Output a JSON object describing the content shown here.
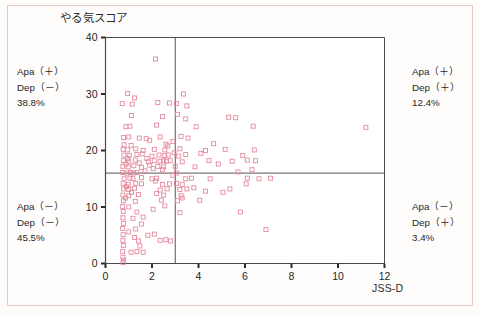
{
  "figure": {
    "frame_color": "#edc7cc",
    "background": "#fefdfc"
  },
  "quadrants": {
    "top_left": {
      "line1": "Apa（＋）",
      "line2": "Dep（－）",
      "percent": "38.8%"
    },
    "top_right": {
      "line1": "Apa（＋）",
      "line2": "Dep（＋）",
      "percent": "12.4%"
    },
    "bottom_left": {
      "line1": "Apa（－）",
      "line2": "Dep（－）",
      "percent": "45.5%"
    },
    "bottom_right": {
      "line1": "Apa（－）",
      "line2": "Dep（＋）",
      "percent": "3.4%"
    }
  },
  "chart_data": {
    "type": "scatter",
    "title": "",
    "xlabel": "JSS-D",
    "ylabel": "やる気スコア",
    "xlim": [
      0,
      12
    ],
    "ylim": [
      0,
      40
    ],
    "xticks": [
      0,
      2,
      4,
      6,
      8,
      10,
      12
    ],
    "yticks": [
      0,
      10,
      20,
      30,
      40
    ],
    "grid": false,
    "legend": "none",
    "marker": {
      "shape": "open-square",
      "size_px": 4,
      "edge_color": "#e58a9e",
      "fill_color": "none"
    },
    "reference_lines": [
      {
        "axis": "x",
        "value": 3,
        "color": "#555555",
        "label": "JSS-D cutoff"
      },
      {
        "axis": "y",
        "value": 16,
        "color": "#555555",
        "label": "yaruki score cutoff"
      }
    ],
    "annotations": [
      {
        "text": "Apa（＋） Dep（－） 38.8%",
        "quadrant": "top-left"
      },
      {
        "text": "Apa（＋） Dep（＋） 12.4%",
        "quadrant": "top-right"
      },
      {
        "text": "Apa（－） Dep（－） 45.5%",
        "quadrant": "bottom-left"
      },
      {
        "text": "Apa（－） Dep（＋） 3.4%",
        "quadrant": "bottom-right"
      }
    ],
    "points": [
      [
        2.15,
        36.2
      ],
      [
        0.95,
        30.1
      ],
      [
        1.25,
        29.3
      ],
      [
        3.35,
        30.0
      ],
      [
        0.72,
        28.3
      ],
      [
        1.15,
        28.2
      ],
      [
        2.25,
        28.5
      ],
      [
        2.75,
        28.4
      ],
      [
        3.05,
        28.3
      ],
      [
        3.5,
        27.9
      ],
      [
        1.12,
        26.2
      ],
      [
        2.45,
        26.0
      ],
      [
        3.1,
        26.4
      ],
      [
        3.45,
        25.6
      ],
      [
        5.3,
        25.9
      ],
      [
        5.6,
        25.8
      ],
      [
        0.88,
        24.2
      ],
      [
        1.05,
        24.3
      ],
      [
        2.2,
        24.5
      ],
      [
        3.9,
        24.2
      ],
      [
        6.35,
        24.3
      ],
      [
        11.2,
        24.1
      ],
      [
        0.78,
        22.3
      ],
      [
        1.0,
        22.4
      ],
      [
        1.45,
        22.2
      ],
      [
        1.75,
        22.1
      ],
      [
        2.35,
        22.4
      ],
      [
        3.25,
        22.5
      ],
      [
        3.55,
        22.2
      ],
      [
        0.8,
        21.0
      ],
      [
        1.1,
        20.9
      ],
      [
        2.6,
        21.1
      ],
      [
        4.65,
        21.2
      ],
      [
        0.76,
        20.2
      ],
      [
        0.95,
        20.1
      ],
      [
        1.3,
        20.3
      ],
      [
        1.62,
        20.0
      ],
      [
        2.1,
        20.2
      ],
      [
        2.55,
        20.1
      ],
      [
        3.2,
        20.3
      ],
      [
        4.3,
        20.0
      ],
      [
        5.15,
        20.2
      ],
      [
        6.4,
        20.1
      ],
      [
        0.79,
        19.2
      ],
      [
        1.02,
        19.1
      ],
      [
        1.35,
        19.3
      ],
      [
        2.0,
        19.0
      ],
      [
        2.3,
        19.2
      ],
      [
        2.55,
        19.1
      ],
      [
        2.7,
        19.2
      ],
      [
        3.15,
        19.0
      ],
      [
        3.45,
        19.3
      ],
      [
        5.9,
        19.1
      ],
      [
        0.77,
        18.2
      ],
      [
        1.0,
        18.1
      ],
      [
        1.28,
        18.3
      ],
      [
        1.85,
        18.0
      ],
      [
        2.1,
        18.2
      ],
      [
        2.35,
        18.1
      ],
      [
        2.5,
        18.2
      ],
      [
        2.62,
        18.1
      ],
      [
        2.78,
        18.2
      ],
      [
        3.3,
        18.0
      ],
      [
        4.45,
        18.2
      ],
      [
        5.45,
        18.1
      ],
      [
        6.1,
        18.3
      ],
      [
        6.45,
        18.2
      ],
      [
        0.75,
        17.2
      ],
      [
        0.98,
        17.1
      ],
      [
        1.22,
        17.3
      ],
      [
        1.55,
        17.0
      ],
      [
        2.25,
        17.2
      ],
      [
        2.5,
        17.1
      ],
      [
        3.0,
        17.2
      ],
      [
        3.85,
        17.1
      ],
      [
        0.74,
        16.1
      ],
      [
        0.92,
        16.0
      ],
      [
        1.08,
        16.1
      ],
      [
        1.2,
        16.0
      ],
      [
        1.35,
        16.1
      ],
      [
        3.05,
        16.0
      ],
      [
        0.8,
        15.0
      ],
      [
        1.05,
        15.1
      ],
      [
        1.18,
        15.0
      ],
      [
        1.55,
        15.2
      ],
      [
        2.0,
        15.0
      ],
      [
        2.2,
        15.1
      ],
      [
        3.45,
        15.0
      ],
      [
        3.7,
        15.1
      ],
      [
        4.5,
        15.0
      ],
      [
        6.1,
        15.1
      ],
      [
        6.6,
        15.0
      ],
      [
        7.1,
        15.1
      ],
      [
        0.76,
        14.1
      ],
      [
        0.98,
        14.0
      ],
      [
        1.3,
        14.2
      ],
      [
        1.55,
        14.1
      ],
      [
        2.45,
        14.0
      ],
      [
        2.75,
        14.1
      ],
      [
        3.05,
        14.2
      ],
      [
        3.3,
        14.0
      ],
      [
        6.05,
        14.1
      ],
      [
        0.78,
        13.2
      ],
      [
        1.0,
        13.1
      ],
      [
        1.25,
        13.3
      ],
      [
        2.35,
        13.0
      ],
      [
        2.65,
        13.2
      ],
      [
        3.2,
        13.1
      ],
      [
        3.5,
        13.2
      ],
      [
        0.75,
        12.1
      ],
      [
        1.0,
        12.0
      ],
      [
        1.42,
        12.2
      ],
      [
        2.5,
        12.1
      ],
      [
        3.25,
        12.0
      ],
      [
        0.77,
        11.1
      ],
      [
        1.28,
        11.0
      ],
      [
        2.4,
        11.2
      ],
      [
        3.1,
        11.1
      ],
      [
        0.74,
        10.1
      ],
      [
        1.0,
        10.0
      ],
      [
        2.55,
        10.2
      ],
      [
        0.76,
        9.2
      ],
      [
        1.35,
        9.1
      ],
      [
        3.2,
        9.0
      ],
      [
        5.8,
        9.1
      ],
      [
        0.75,
        8.1
      ],
      [
        1.18,
        8.0
      ],
      [
        1.62,
        8.2
      ],
      [
        0.78,
        7.1
      ],
      [
        1.55,
        7.0
      ],
      [
        0.74,
        6.2
      ],
      [
        1.3,
        6.1
      ],
      [
        6.9,
        6.0
      ],
      [
        0.76,
        5.1
      ],
      [
        1.82,
        5.0
      ],
      [
        2.1,
        5.2
      ],
      [
        0.75,
        4.1
      ],
      [
        1.42,
        4.0
      ],
      [
        2.35,
        4.1
      ],
      [
        2.6,
        4.2
      ],
      [
        2.8,
        4.0
      ],
      [
        0.77,
        3.2
      ],
      [
        1.48,
        3.1
      ],
      [
        0.74,
        2.1
      ],
      [
        1.1,
        2.0
      ],
      [
        1.35,
        2.1
      ],
      [
        1.62,
        2.0
      ],
      [
        0.75,
        1.1
      ],
      [
        0.78,
        0.6
      ],
      [
        0.76,
        0.2
      ],
      [
        1.9,
        21.8
      ],
      [
        2.9,
        21.6
      ],
      [
        4.1,
        19.5
      ],
      [
        4.85,
        17.6
      ],
      [
        2.05,
        16.8
      ],
      [
        2.45,
        16.6
      ],
      [
        1.7,
        16.4
      ],
      [
        0.9,
        13.6
      ],
      [
        1.12,
        12.6
      ],
      [
        0.86,
        11.6
      ],
      [
        1.0,
        5.6
      ],
      [
        1.25,
        4.6
      ],
      [
        2.2,
        12.4
      ],
      [
        2.05,
        9.6
      ],
      [
        3.3,
        11.6
      ],
      [
        3.8,
        13.4
      ],
      [
        5.05,
        12.6
      ],
      [
        5.35,
        13.2
      ],
      [
        4.05,
        11.2
      ],
      [
        4.3,
        12.8
      ],
      [
        1.45,
        17.8
      ],
      [
        1.9,
        17.4
      ],
      [
        2.68,
        20.8
      ],
      [
        2.95,
        19.6
      ],
      [
        0.95,
        18.6
      ],
      [
        0.88,
        17.6
      ],
      [
        1.58,
        19.4
      ],
      [
        1.78,
        18.6
      ],
      [
        2.15,
        14.6
      ],
      [
        2.9,
        15.6
      ],
      [
        6.3,
        16.6
      ],
      [
        5.7,
        16.2
      ]
    ]
  }
}
